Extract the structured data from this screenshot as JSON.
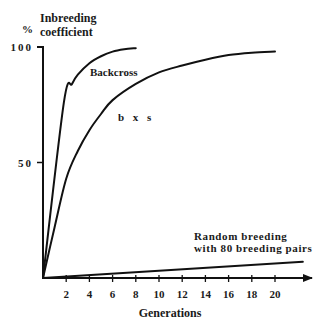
{
  "chart_data": {
    "type": "line",
    "title": "Inbreeding coefficient",
    "ylabel_unit": "%",
    "ylabel_lines": [
      "Inbreeding",
      "coefficient"
    ],
    "xlabel": "Generations",
    "xlim": [
      0,
      23
    ],
    "ylim": [
      0,
      100
    ],
    "x_ticks": [
      2,
      4,
      6,
      8,
      10,
      12,
      14,
      16,
      18,
      20
    ],
    "x_tick_labels": [
      "2",
      "4",
      "6",
      "8",
      "10",
      "12",
      "14",
      "16",
      "18",
      "20"
    ],
    "y_ticks": [
      50,
      100
    ],
    "y_tick_labels": [
      "50",
      "100"
    ],
    "grid": false,
    "legend": "none (series labeled inline)",
    "series": [
      {
        "name": "Backcross",
        "label_lines": [
          "Backcross"
        ],
        "x": [
          0,
          1.8,
          2.5,
          3,
          4,
          5,
          6,
          7,
          8
        ],
        "y": [
          0,
          76,
          84,
          88,
          93,
          96,
          98,
          99,
          99.5
        ]
      },
      {
        "name": "b x s",
        "label_lines": [
          "b x s"
        ],
        "x": [
          0,
          1,
          2,
          3,
          4,
          5,
          6,
          8,
          10,
          12,
          14,
          16,
          18,
          20
        ],
        "y": [
          0,
          22,
          43,
          55,
          64,
          71,
          77,
          84,
          89,
          92,
          94.5,
          96.5,
          97.5,
          98
        ]
      },
      {
        "name": "Random breeding with 80 breeding pairs",
        "label_lines": [
          "Random breeding",
          "with 80 breeding pairs"
        ],
        "x": [
          0,
          22.4
        ],
        "y": [
          0,
          7
        ]
      }
    ]
  }
}
